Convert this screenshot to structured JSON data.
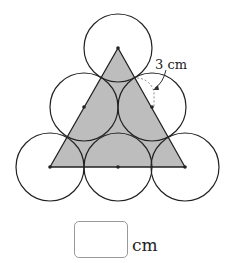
{
  "figure": {
    "measure_label": "3 cm",
    "circle_radius_note": "radius of each circle",
    "circle_count": 6,
    "triangle_fill": "#bdbdbd",
    "stroke_color": "#222222",
    "circles": [
      {
        "cx": 118,
        "cy": 48
      },
      {
        "cx": 84,
        "cy": 107
      },
      {
        "cx": 152,
        "cy": 107
      },
      {
        "cx": 50,
        "cy": 167
      },
      {
        "cx": 118,
        "cy": 167
      },
      {
        "cx": 185,
        "cy": 167
      }
    ],
    "radius_px": 34,
    "triangle": [
      [
        118,
        48
      ],
      [
        50,
        167
      ],
      [
        185,
        167
      ]
    ]
  },
  "answer": {
    "value": "",
    "unit": "cm"
  }
}
